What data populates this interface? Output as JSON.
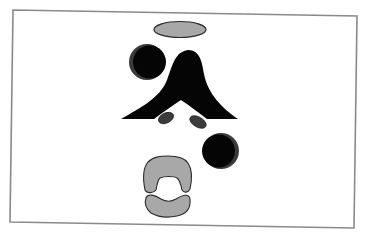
{
  "diagram": {
    "colors": {
      "background": "#ffffff",
      "frame_stroke": "#8a8a8a",
      "black_fill": "#050505",
      "crescent_fill": "#3a3a3a",
      "gray_fill": "#a8a8a8",
      "dark_gray_fill": "#3c3c3c",
      "outline": "#2a2a2a"
    },
    "shapes": [
      {
        "id": "frame",
        "type": "polygon",
        "label": ""
      },
      {
        "id": "top-ellipse",
        "type": "ellipse",
        "fill": "gray",
        "label": ""
      },
      {
        "id": "upper-circle",
        "type": "circle",
        "fill": "black",
        "crescent": "left",
        "label": ""
      },
      {
        "id": "central-peak",
        "type": "path",
        "fill": "black",
        "label": ""
      },
      {
        "id": "left-small-oval",
        "type": "ellipse",
        "fill": "dark-gray",
        "label": ""
      },
      {
        "id": "right-small-oval",
        "type": "ellipse",
        "fill": "dark-gray",
        "label": ""
      },
      {
        "id": "lower-circle",
        "type": "circle",
        "fill": "black",
        "crescent": "right",
        "label": ""
      },
      {
        "id": "gray-arch",
        "type": "path",
        "fill": "gray",
        "label": ""
      },
      {
        "id": "gray-kidney",
        "type": "path",
        "fill": "gray",
        "label": ""
      }
    ]
  }
}
